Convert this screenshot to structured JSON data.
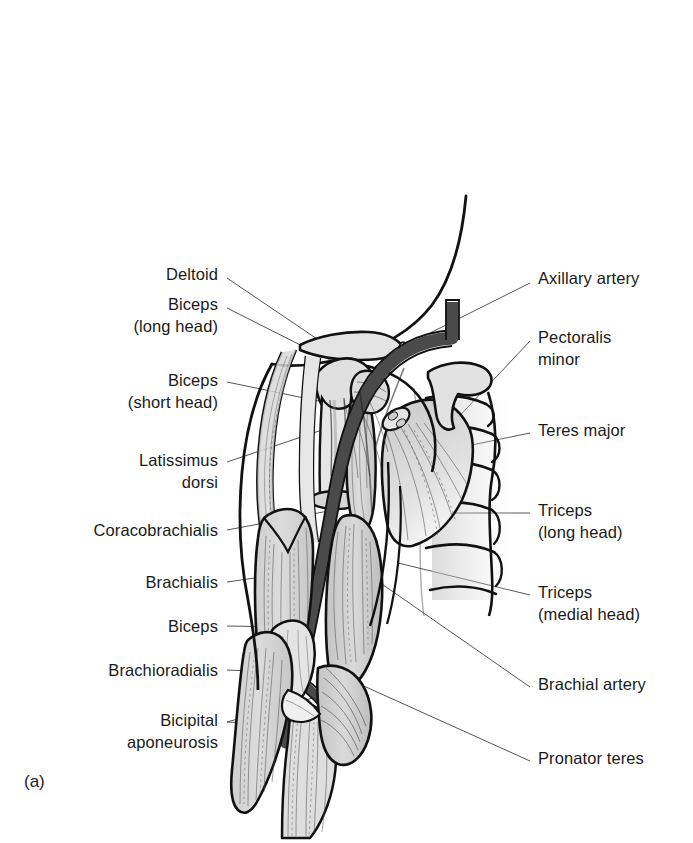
{
  "figure": {
    "panel_letter": "(a)",
    "background_color": "#ffffff",
    "ink_color": "#111111",
    "leader_line_color": "#555555",
    "artery_color": "#4a4a4a",
    "muscle_fill": "#d5d5d5",
    "bone_fill": "#e2e2e2",
    "tendon_fill": "#efefef"
  },
  "labels_left": [
    {
      "id": "deltoid",
      "text": "Deltoid",
      "lines": [
        "Deltoid"
      ],
      "x": 218,
      "y": 264,
      "leader": [
        [
          227,
          278
        ],
        [
          318,
          339
        ]
      ]
    },
    {
      "id": "biceps-long-head",
      "text": "Biceps (long head)",
      "lines": [
        "Biceps",
        "(long head)"
      ],
      "x": 218,
      "y": 294,
      "leader": [
        [
          227,
          308
        ],
        [
          330,
          360
        ]
      ]
    },
    {
      "id": "biceps-short-head",
      "text": "Biceps (short head)",
      "lines": [
        "Biceps",
        "(short head)"
      ],
      "x": 218,
      "y": 370,
      "leader": [
        [
          227,
          382
        ],
        [
          330,
          402
        ]
      ]
    },
    {
      "id": "latissimus-dorsi",
      "text": "Latissimus dorsi",
      "lines": [
        "Latissimus",
        "dorsi"
      ],
      "x": 218,
      "y": 450,
      "leader": [
        [
          227,
          462
        ],
        [
          318,
          428
        ]
      ]
    },
    {
      "id": "coracobrachialis",
      "text": "Coracobrachialis",
      "lines": [
        "Coracobrachialis"
      ],
      "x": 218,
      "y": 520,
      "leader": [
        [
          227,
          530
        ],
        [
          352,
          505
        ]
      ]
    },
    {
      "id": "brachialis",
      "text": "Brachialis",
      "lines": [
        "Brachialis"
      ],
      "x": 218,
      "y": 572,
      "leader": [
        [
          227,
          582
        ],
        [
          352,
          563
        ]
      ]
    },
    {
      "id": "biceps",
      "text": "Biceps",
      "lines": [
        "Biceps"
      ],
      "x": 218,
      "y": 616,
      "leader": [
        [
          227,
          626
        ],
        [
          283,
          626
        ]
      ]
    },
    {
      "id": "brachioradialis",
      "text": "Brachioradialis",
      "lines": [
        "Brachioradialis"
      ],
      "x": 218,
      "y": 660,
      "leader": [
        [
          227,
          670
        ],
        [
          308,
          673
        ]
      ]
    },
    {
      "id": "bicipital-aponeurosis",
      "text": "Bicipital aponeurosis",
      "lines": [
        "Bicipital",
        "aponeurosis"
      ],
      "x": 218,
      "y": 710,
      "leader": [
        [
          227,
          722
        ],
        [
          320,
          700
        ]
      ]
    }
  ],
  "labels_right": [
    {
      "id": "axillary-artery",
      "text": "Axillary artery",
      "lines": [
        "Axillary artery"
      ],
      "x": 538,
      "y": 268,
      "leader": [
        [
          530,
          283
        ],
        [
          440,
          331
        ]
      ]
    },
    {
      "id": "pectoralis-minor",
      "text": "Pectoralis minor",
      "lines": [
        "Pectoralis",
        "minor"
      ],
      "x": 538,
      "y": 327,
      "leader": [
        [
          530,
          340
        ],
        [
          452,
          420
        ]
      ]
    },
    {
      "id": "teres-major",
      "text": "Teres major",
      "lines": [
        "Teres major"
      ],
      "x": 538,
      "y": 420,
      "leader": [
        [
          530,
          433
        ],
        [
          430,
          452
        ]
      ]
    },
    {
      "id": "triceps-long-head",
      "text": "Triceps (long head)",
      "lines": [
        "Triceps",
        "(long head)"
      ],
      "x": 538,
      "y": 500,
      "leader": [
        [
          530,
          513
        ],
        [
          398,
          513
        ]
      ]
    },
    {
      "id": "triceps-medial-head",
      "text": "Triceps (medial head)",
      "lines": [
        "Triceps",
        "(medial head)"
      ],
      "x": 538,
      "y": 582,
      "leader": [
        [
          530,
          595
        ],
        [
          400,
          563
        ]
      ]
    },
    {
      "id": "brachial-artery",
      "text": "Brachial artery",
      "lines": [
        "Brachial artery"
      ],
      "x": 538,
      "y": 674,
      "leader": [
        [
          530,
          687
        ],
        [
          335,
          551
        ]
      ]
    },
    {
      "id": "pronator-teres",
      "text": "Pronator teres",
      "lines": [
        "Pronator teres"
      ],
      "x": 538,
      "y": 748,
      "leader": [
        [
          530,
          761
        ],
        [
          348,
          679
        ]
      ]
    }
  ]
}
